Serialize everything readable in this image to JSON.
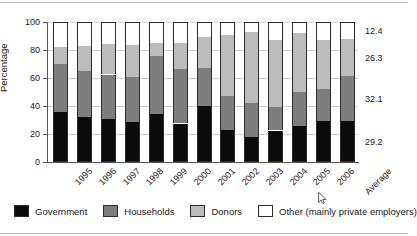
{
  "chart_data": {
    "type": "bar",
    "subtype": "stacked-100-percent",
    "title": "",
    "xlabel": "",
    "ylabel": "Percentage",
    "ylim": [
      0,
      100
    ],
    "yticks": [
      0,
      20,
      40,
      60,
      80,
      100
    ],
    "grid": true,
    "legend_position": "bottom",
    "categories": [
      "1995",
      "1996",
      "1997",
      "1998",
      "1999",
      "2000",
      "2001",
      "2002",
      "2003",
      "2004",
      "2005",
      "2006",
      "Average"
    ],
    "series": [
      {
        "name": "Government",
        "color": "#0b0b0b",
        "values": [
          36.0,
          32.0,
          31.0,
          28.5,
          34.5,
          27.5,
          40.0,
          23.0,
          18.0,
          22.5,
          26.0,
          29.0,
          29.2
        ]
      },
      {
        "name": "Households",
        "color": "#7d7d7d",
        "values": [
          34.0,
          33.0,
          31.5,
          32.5,
          41.5,
          39.0,
          27.0,
          24.0,
          24.0,
          16.5,
          24.0,
          23.0,
          32.1
        ]
      },
      {
        "name": "Donors",
        "color": "#bcbcbc",
        "values": [
          12.0,
          18.0,
          21.5,
          22.5,
          9.0,
          18.5,
          22.0,
          44.0,
          51.0,
          48.0,
          42.5,
          35.0,
          26.3
        ]
      },
      {
        "name": "Other (mainly private employers)",
        "color": "#ffffff",
        "values": [
          18.0,
          17.0,
          16.0,
          16.5,
          15.0,
          15.0,
          11.0,
          9.0,
          7.0,
          13.0,
          7.5,
          13.0,
          12.4
        ]
      }
    ],
    "value_labels": {
      "column": "Average",
      "items": [
        {
          "series": "Other (mainly private employers)",
          "text": "12.4",
          "value": 12.4
        },
        {
          "series": "Donors",
          "text": "26.3",
          "value": 26.3
        },
        {
          "series": "Households",
          "text": "32.1",
          "value": 32.1
        },
        {
          "series": "Government",
          "text": "29.2",
          "value": 29.2
        }
      ]
    }
  },
  "axis": {
    "y_title": "Percentage",
    "y_tick_labels": [
      "0",
      "20",
      "40",
      "60",
      "80",
      "100"
    ]
  },
  "legend": {
    "items": [
      {
        "label": "Government",
        "swatch": "black-swatch"
      },
      {
        "label": "Households",
        "swatch": "dark-gray-swatch"
      },
      {
        "label": "Donors",
        "swatch": "light-gray-swatch"
      },
      {
        "label": "Other (mainly private employers)",
        "swatch": "white-swatch"
      }
    ]
  },
  "colors": {
    "government": "#0b0b0b",
    "households": "#7d7d7d",
    "donors": "#bcbcbc",
    "other": "#ffffff",
    "grid": "#d6d6d6",
    "axis": "#555555",
    "text": "#222222"
  }
}
